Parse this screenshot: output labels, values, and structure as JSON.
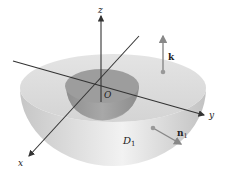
{
  "figure": {
    "labels": {
      "z_axis": "z",
      "y_axis": "y",
      "x_axis": "x",
      "origin": "O",
      "region": "D",
      "region_sub": "1",
      "vector_k": "k",
      "vector_n": "n",
      "vector_n_sub": "1"
    },
    "colors": {
      "outer_shell_top": "#dcdcdc",
      "outer_shell_side": "#cfcfcf",
      "inner_cavity": "#9a9a9a",
      "inner_cavity_wall": "#b3b3b3",
      "axis": "#333333",
      "vector": "#888888"
    }
  }
}
